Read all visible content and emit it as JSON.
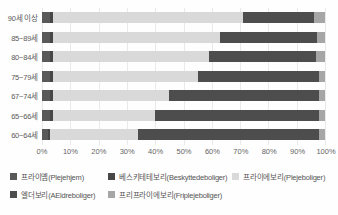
{
  "chart_data": {
    "type": "bar",
    "orientation": "horizontal",
    "stacked": true,
    "normalized_percent": true,
    "categories": [
      "90세 이상",
      "85~89세",
      "80~84세",
      "75~79세",
      "67~74세",
      "65~66세",
      "60~64세"
    ],
    "series": [
      {
        "name": "프라이옘(Plejehjem)",
        "color": "#595959",
        "values": [
          3,
          3,
          3,
          3,
          3,
          3,
          2
        ]
      },
      {
        "name": "베스키테테보리(Beskyttedeboliger)",
        "color": "#474747",
        "values": [
          1,
          1,
          1,
          1,
          1,
          1,
          1
        ]
      },
      {
        "name": "프라이에보리(Plejeboliger)",
        "color": "#d9d9d9",
        "values": [
          67,
          59,
          55,
          51,
          41,
          36,
          31
        ]
      },
      {
        "name": "엘더보리(AEldreboliger)",
        "color": "#4d4d4d",
        "values": [
          25,
          34,
          38,
          43,
          53,
          58,
          64
        ]
      },
      {
        "name": "프리프라이에보리(Friplejeboliger)",
        "color": "#a6a6a6",
        "values": [
          4,
          3,
          3,
          2,
          2,
          2,
          2
        ]
      }
    ],
    "x_ticks": [
      "0%",
      "10%",
      "20%",
      "30%",
      "40%",
      "50%",
      "60%",
      "70%",
      "80%",
      "90%",
      "100%"
    ],
    "xlim": [
      0,
      100
    ],
    "xlabel": "",
    "ylabel": "",
    "title": "",
    "grid": "vertical",
    "gridline_color": "#e9e9e9",
    "legend_position": "bottom"
  }
}
